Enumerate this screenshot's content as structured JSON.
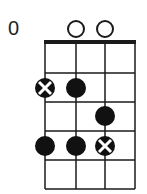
{
  "diagram": {
    "type": "chord-diagram",
    "start_fret_label": "0",
    "strings": 4,
    "frets": 4,
    "open_strings": [
      2,
      3
    ],
    "dots": [
      {
        "string": 1,
        "fret": 1,
        "type": "x"
      },
      {
        "string": 2,
        "fret": 1,
        "type": "filled"
      },
      {
        "string": 3,
        "fret": 2,
        "type": "filled"
      },
      {
        "string": 1,
        "fret": 3,
        "type": "filled"
      },
      {
        "string": 2,
        "fret": 3,
        "type": "filled"
      },
      {
        "string": 3,
        "fret": 3,
        "type": "x"
      }
    ],
    "colors": {
      "line": "#1a1a1a",
      "dot": "#111111",
      "background": "#ffffff"
    }
  }
}
